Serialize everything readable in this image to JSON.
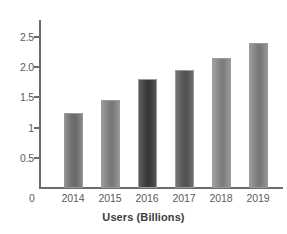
{
  "chart_data": {
    "type": "bar",
    "title": "",
    "subtitle": "",
    "xlabel": "Users (Billions)",
    "ylabel": "",
    "categories": [
      "2014",
      "2015",
      "2016",
      "2017",
      "2018",
      "2019"
    ],
    "values": [
      1.25,
      1.45,
      1.8,
      1.95,
      2.15,
      2.4
    ],
    "series": [
      {
        "name": "Users (Billions)",
        "values": [
          1.25,
          1.45,
          1.8,
          1.95,
          2.15,
          2.4
        ]
      }
    ],
    "ylim": [
      0,
      2.75
    ],
    "ytick_labels": [
      "0",
      "0.5",
      "1",
      "1.5",
      "2.0",
      "2.5"
    ],
    "ytick_values": [
      0,
      0.5,
      1,
      1.5,
      2.0,
      2.5
    ],
    "grid": false,
    "legend": "none",
    "bar_colors": [
      "#7c7c7c",
      "#8a8a8a",
      "#4a4a4a",
      "#636363",
      "#8f8f8f",
      "#8a8a8a"
    ],
    "annotations": []
  },
  "axes": {
    "zero_label": "0",
    "x_title": "Users (Billions)"
  },
  "colors": {
    "background": "#ffffff",
    "axis": "#6b6b6b",
    "tick_text": "#5b5b5b",
    "title_text": "#3d3d3d"
  }
}
